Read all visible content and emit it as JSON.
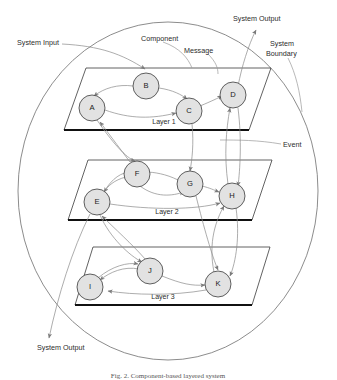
{
  "figure": {
    "caption": "Fig. 2. Component-based layered system",
    "boundary_label": "System Boundary",
    "environment_label": "The Environment"
  },
  "annotations": {
    "system_input": "System Input",
    "component": "Component",
    "message": "Message",
    "system_output_top": "System Output",
    "system_output_bottom": "System Output",
    "event": "Event",
    "system_boundary_line1": "System",
    "system_boundary_line2": "Boundary"
  },
  "layers": [
    {
      "id": "layer1",
      "label": "Layer 1"
    },
    {
      "id": "layer2",
      "label": "Layer 2"
    },
    {
      "id": "layer3",
      "label": "Layer 3"
    }
  ],
  "components": [
    {
      "id": "A",
      "label": "A",
      "layer": "layer1",
      "cx": 92,
      "cy": 108
    },
    {
      "id": "B",
      "label": "B",
      "layer": "layer1",
      "cx": 146,
      "cy": 86
    },
    {
      "id": "C",
      "label": "C",
      "layer": "layer1",
      "cx": 189,
      "cy": 111
    },
    {
      "id": "D",
      "label": "D",
      "layer": "layer1",
      "cx": 233,
      "cy": 95
    },
    {
      "id": "E",
      "label": "E",
      "layer": "layer2",
      "cx": 97,
      "cy": 202
    },
    {
      "id": "F",
      "label": "F",
      "layer": "layer2",
      "cx": 137,
      "cy": 174
    },
    {
      "id": "G",
      "label": "G",
      "layer": "layer2",
      "cx": 190,
      "cy": 184
    },
    {
      "id": "H",
      "label": "H",
      "layer": "layer2",
      "cx": 232,
      "cy": 196
    },
    {
      "id": "I",
      "label": "I",
      "layer": "layer3",
      "cx": 90,
      "cy": 287
    },
    {
      "id": "J",
      "label": "J",
      "layer": "layer3",
      "cx": 150,
      "cy": 271
    },
    {
      "id": "K",
      "label": "K",
      "layer": "layer3",
      "cx": 218,
      "cy": 284
    }
  ],
  "colors": {
    "node_fill": "#e2e2e2",
    "node_stroke": "#3a3a3a",
    "message_stroke": "#8a8a8a",
    "plane_stroke": "#3a3a3a",
    "plane_base": "#111111",
    "boundary_stroke": "#6e6e6e",
    "text": "#2b2b2b",
    "background": "#ffffff"
  }
}
